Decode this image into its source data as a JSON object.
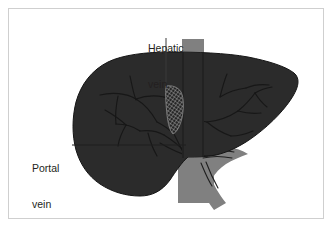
{
  "figure": {
    "frame": {
      "border_color": "#cfcfcf",
      "background_color": "#ffffff"
    },
    "colors": {
      "liver_fill": "#2b2b2b",
      "liver_outline": "#1b1b1b",
      "vessel_gray": "#808080",
      "vessel_gray_dark": "#6e6e6e",
      "vessel_line": "#111111",
      "label_text": "#231f20",
      "leader_line": "#3a3a3a",
      "hatch_line": "#9a9a9a"
    },
    "labels": [
      {
        "id": "hepatic-vein",
        "line1": "Hepatic",
        "line2": "vein",
        "full_text": "Hepatic vein"
      },
      {
        "id": "portal-vein",
        "line1": "Portal",
        "line2": "vein",
        "full_text": "Portal vein"
      }
    ],
    "structures": [
      {
        "name": "liver",
        "description": "large dark liver silhouette"
      },
      {
        "name": "inferior-vena-cava",
        "description": "gray vertical band passing behind liver"
      },
      {
        "name": "portal-vein-trunk",
        "description": "gray Y-shaped branching vessel below liver"
      },
      {
        "name": "hepatic-vein-hatched",
        "description": "cross-hatched curved vessel segment"
      },
      {
        "name": "intrahepatic-vessel-tree",
        "description": "branching vessel outlines inside liver"
      }
    ]
  }
}
